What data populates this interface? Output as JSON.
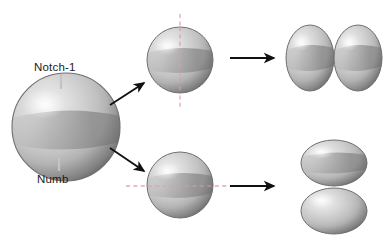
{
  "figure": {
    "background_color": "#ffffff",
    "width": 390,
    "height": 241
  },
  "labels": {
    "notch1": "Notch-1",
    "numb": "Numb"
  },
  "colors": {
    "cell_light": "#e9e9e9",
    "cell_mid": "#b8b8b8",
    "cell_dark": "#8f8f8f",
    "cell_band": "#9a9a9a",
    "cell_outline": "#6f6f6f",
    "arrow": "#111111",
    "division_plane": "#e0a8b4",
    "leader_line": "#bdbdbd",
    "text": "#1a1a1a"
  },
  "stages": {
    "parent": {
      "name": "parent-cell",
      "shape": "sphere",
      "cx": 66,
      "cy": 127,
      "r": 54,
      "notch_pole": "top",
      "numb_pole": "bottom"
    },
    "vertical_division": {
      "name": "vertical-cleavage-cell",
      "shape": "sphere",
      "cx": 180,
      "cy": 60,
      "r": 33,
      "plane_orientation": "vertical",
      "division_type": "symmetric"
    },
    "horizontal_division": {
      "name": "horizontal-cleavage-cell",
      "shape": "sphere",
      "cx": 180,
      "cy": 185,
      "r": 33,
      "plane_orientation": "horizontal",
      "division_type": "asymmetric"
    },
    "symmetric_daughters": {
      "name": "side-by-side-daughter-cells",
      "arrangement": "side-by-side",
      "count": 2
    },
    "asymmetric_daughters": {
      "name": "stacked-daughter-cells",
      "arrangement": "stacked",
      "count": 2
    }
  },
  "arrows": [
    {
      "name": "arrow-parent-to-vertical",
      "x1": 110,
      "y1": 104,
      "x2": 146,
      "y2": 81
    },
    {
      "name": "arrow-parent-to-horizontal",
      "x1": 110,
      "y1": 148,
      "x2": 146,
      "y2": 172
    },
    {
      "name": "arrow-vertical-to-symmetric",
      "x1": 228,
      "y1": 58,
      "x2": 276,
      "y2": 58
    },
    {
      "name": "arrow-horizontal-to-asymmetric",
      "x1": 228,
      "y1": 186,
      "x2": 276,
      "y2": 186
    }
  ],
  "division_planes": [
    {
      "name": "vertical-division-plane",
      "orientation": "vertical",
      "x1": 180,
      "y1": 14,
      "x2": 180,
      "y2": 106
    },
    {
      "name": "horizontal-division-plane",
      "orientation": "horizontal",
      "x1": 128,
      "y1": 186,
      "x2": 232,
      "y2": 186
    }
  ],
  "leader_lines": [
    {
      "name": "notch1-leader-line",
      "x1": 61,
      "y1": 74,
      "x2": 61,
      "y2": 89
    },
    {
      "name": "numb-leader-line",
      "x1": 59,
      "y1": 158,
      "x2": 59,
      "y2": 171
    }
  ]
}
